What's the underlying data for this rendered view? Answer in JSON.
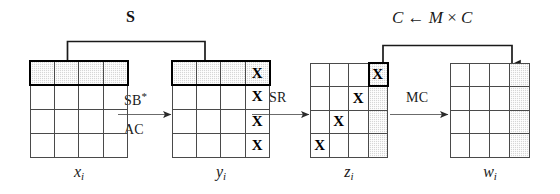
{
  "figure": {
    "type": "aes-round-diagram",
    "grid_size": {
      "rows": 4,
      "cols": 4
    }
  },
  "states": [
    {
      "id": "x",
      "label": "x",
      "subscript": "i",
      "highlight": "top-row",
      "shaded_cells": [
        [
          0,
          0
        ],
        [
          0,
          1
        ],
        [
          0,
          2
        ],
        [
          0,
          3
        ]
      ],
      "marked_cells": [],
      "mark_glyph": "",
      "emphasis_box": "row-0"
    },
    {
      "id": "y",
      "label": "y",
      "subscript": "i",
      "highlight": "top-row",
      "shaded_cells": [
        [
          0,
          0
        ],
        [
          0,
          1
        ],
        [
          0,
          2
        ],
        [
          0,
          3
        ]
      ],
      "marked_cells": [
        [
          0,
          3
        ],
        [
          1,
          3
        ],
        [
          2,
          3
        ],
        [
          3,
          3
        ]
      ],
      "mark_glyph": "X",
      "emphasis_box": "row-0"
    },
    {
      "id": "z",
      "label": "z",
      "subscript": "i",
      "highlight": "right-column",
      "shaded_cells": [
        [
          0,
          3
        ],
        [
          1,
          3
        ],
        [
          2,
          3
        ],
        [
          3,
          3
        ]
      ],
      "marked_cells": [
        [
          0,
          3
        ],
        [
          1,
          2
        ],
        [
          2,
          1
        ],
        [
          3,
          0
        ]
      ],
      "mark_glyph": "X",
      "emphasis_box": "cell-0-3"
    },
    {
      "id": "w",
      "label": "w",
      "subscript": "i",
      "highlight": "right-column",
      "shaded_cells": [
        [
          0,
          3
        ],
        [
          1,
          3
        ],
        [
          2,
          3
        ],
        [
          3,
          3
        ]
      ],
      "marked_cells": [],
      "mark_glyph": "",
      "emphasis_box": "none"
    }
  ],
  "transitions": [
    {
      "id": "t1",
      "from": "x",
      "to": "y",
      "line1": "SB",
      "line1_superscript": "*",
      "line2": "AC"
    },
    {
      "id": "t2",
      "from": "y",
      "to": "z",
      "line1": "SR",
      "line1_superscript": "",
      "line2": ""
    },
    {
      "id": "t3",
      "from": "z",
      "to": "w",
      "line1": "MC",
      "line1_superscript": "",
      "line2": ""
    }
  ],
  "brackets": [
    {
      "id": "b1",
      "label": "S",
      "style": "bold",
      "from_state": "x",
      "to_state": "y",
      "description": "row-to-row bracket"
    },
    {
      "id": "b2",
      "label": "C ← M × C",
      "label_parts": {
        "lhs": "C",
        "arrow": "←",
        "matrix": "M",
        "times": "×",
        "rhs": "C"
      },
      "style": "italic-math",
      "from_state": "z",
      "to_state": "w",
      "description": "column-to-column bracket"
    }
  ],
  "colors": {
    "grid_line": "#4a4a4a",
    "emphasis": "#000000",
    "shade_fill": "#d6d6d6",
    "text": "#1a1a1a",
    "background": "#ffffff"
  }
}
